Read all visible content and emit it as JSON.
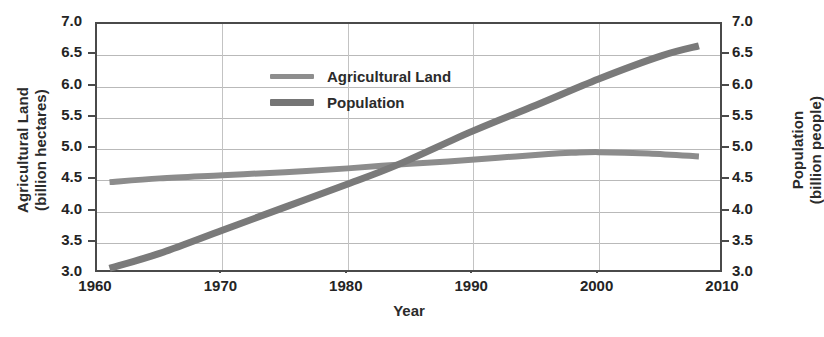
{
  "chart_data": {
    "type": "line",
    "title": "",
    "xlabel": "Year",
    "xlim": [
      1960,
      2010
    ],
    "xticks": [
      1960,
      1970,
      1980,
      1990,
      2000,
      2010
    ],
    "xticklabels": [
      "1960",
      "1970",
      "1980",
      "1990",
      "2000",
      "2010"
    ],
    "grid": true,
    "legend_position": "upper center",
    "left_axis": {
      "label_line1": "Agricultural Land",
      "label_line2": "(billion hectares)",
      "ylim": [
        3.0,
        7.0
      ],
      "yticks": [
        3.0,
        3.5,
        4.0,
        4.5,
        5.0,
        5.5,
        6.0,
        6.5,
        7.0
      ],
      "yticklabels": [
        "3.0",
        "3.5",
        "4.0",
        "4.5",
        "5.0",
        "5.5",
        "6.0",
        "6.5",
        "7.0"
      ]
    },
    "right_axis": {
      "label_line1": "Population",
      "label_line2": "(billion people)",
      "ylim": [
        3.0,
        7.0
      ],
      "yticks": [
        3.0,
        3.5,
        4.0,
        4.5,
        5.0,
        5.5,
        6.0,
        6.5,
        7.0
      ],
      "yticklabels": [
        "3.0",
        "3.5",
        "4.0",
        "4.5",
        "5.0",
        "5.5",
        "6.0",
        "6.5",
        "7.0"
      ]
    },
    "series": [
      {
        "name": "Agricultural Land",
        "axis": "left",
        "unit": "billion hectares",
        "color": "#8c8c8c",
        "linewidth": 6,
        "x": [
          1961,
          1965,
          1970,
          1975,
          1980,
          1984,
          1988,
          1992,
          1996,
          1998,
          2000,
          2004,
          2008
        ],
        "values": [
          4.47,
          4.53,
          4.58,
          4.63,
          4.69,
          4.75,
          4.8,
          4.86,
          4.92,
          4.94,
          4.95,
          4.93,
          4.88
        ]
      },
      {
        "name": "Population",
        "axis": "right",
        "unit": "billion people",
        "color": "#7a7a7a",
        "linewidth": 7,
        "x": [
          1961,
          1965,
          1970,
          1975,
          1980,
          1984,
          1990,
          1995,
          2000,
          2005,
          2008
        ],
        "values": [
          3.09,
          3.33,
          3.7,
          4.07,
          4.44,
          4.75,
          5.29,
          5.7,
          6.12,
          6.49,
          6.65
        ]
      }
    ],
    "annotations": [
      {
        "text": "lines cross",
        "x": 1984,
        "y": 4.75,
        "visible": false
      }
    ]
  },
  "legend": {
    "items": [
      {
        "label": "Agricultural Land",
        "color": "#8e8e8e"
      },
      {
        "label": "Population",
        "color": "#757575"
      }
    ]
  },
  "colors": {
    "axis": "#4a4a4a",
    "grid": "#b9b9b9",
    "text": "#242424",
    "background": "#ffffff"
  }
}
